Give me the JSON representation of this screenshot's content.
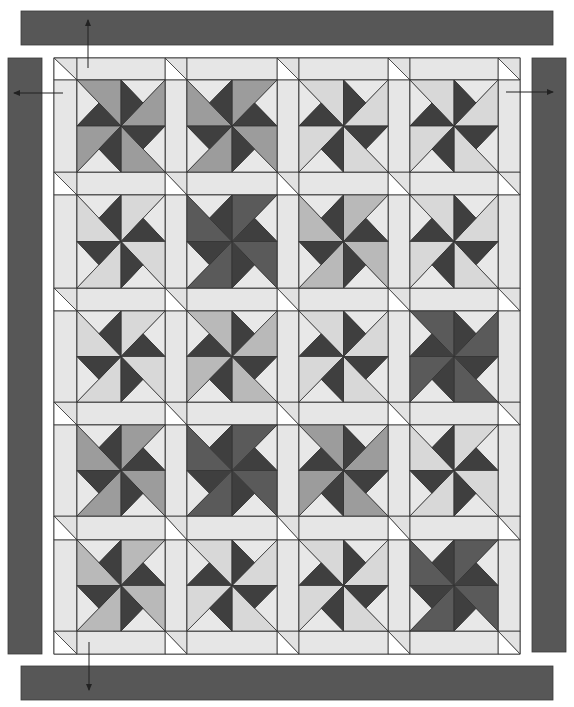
{
  "diagram": {
    "canvas": {
      "width": 574,
      "height": 707
    },
    "colors": {
      "background": "#ffffff",
      "border_bar": "#575757",
      "sashing": "#e6e6e6",
      "cornerstone_light": "#e2e2e2",
      "cornerstone_white": "#ffffff",
      "block_background": "#e8e8e8",
      "small_dark": "#3f3f3f",
      "outline": "#333333",
      "tones": {
        "dark": "#5a5a5a",
        "med": "#9c9c9c",
        "medlight": "#b9b9b9",
        "light": "#d8d8d8"
      }
    },
    "quilt": {
      "x": 54,
      "y": 58,
      "width": 466,
      "height": 596,
      "columns": 4,
      "rows": 5,
      "col_edges": [
        [
          77,
          165
        ],
        [
          187,
          277
        ],
        [
          299,
          388
        ],
        [
          410,
          498
        ]
      ],
      "row_edges": [
        [
          80,
          172
        ],
        [
          195,
          288
        ],
        [
          311,
          402
        ],
        [
          425,
          516
        ],
        [
          540,
          631
        ]
      ]
    },
    "blocks": [
      [
        {
          "type": "A",
          "tone": "med"
        },
        {
          "type": "B",
          "tone": "med"
        },
        {
          "type": "A",
          "tone": "light"
        },
        {
          "type": "A",
          "tone": "light"
        }
      ],
      [
        {
          "type": "B",
          "tone": "light"
        },
        {
          "type": "B",
          "tone": "dark"
        },
        {
          "type": "B",
          "tone": "medlight"
        },
        {
          "type": "A",
          "tone": "light"
        }
      ],
      [
        {
          "type": "B",
          "tone": "light"
        },
        {
          "type": "A",
          "tone": "medlight"
        },
        {
          "type": "A",
          "tone": "light"
        },
        {
          "type": "A",
          "tone": "dark"
        }
      ],
      [
        {
          "type": "B",
          "tone": "med"
        },
        {
          "type": "B",
          "tone": "dark"
        },
        {
          "type": "A",
          "tone": "med"
        },
        {
          "type": "B",
          "tone": "light"
        }
      ],
      [
        {
          "type": "B",
          "tone": "medlight"
        },
        {
          "type": "A",
          "tone": "light"
        },
        {
          "type": "A",
          "tone": "light"
        },
        {
          "type": "B",
          "tone": "dark"
        }
      ]
    ],
    "borders": [
      {
        "name": "top-border",
        "x": 21,
        "y": 11,
        "width": 532,
        "height": 34
      },
      {
        "name": "left-border",
        "x": 8,
        "y": 58,
        "width": 34,
        "height": 596
      },
      {
        "name": "right-border",
        "x": 532,
        "y": 58,
        "width": 34,
        "height": 594
      },
      {
        "name": "bottom-border",
        "x": 21,
        "y": 666,
        "width": 532,
        "height": 34
      }
    ],
    "arrows": [
      {
        "name": "arrow-up",
        "x1": 88,
        "y1": 68,
        "x2": 88,
        "y2": 20
      },
      {
        "name": "arrow-left",
        "x1": 63,
        "y1": 93,
        "x2": 14,
        "y2": 93
      },
      {
        "name": "arrow-right",
        "x1": 506,
        "y1": 92,
        "x2": 553,
        "y2": 92
      },
      {
        "name": "arrow-down",
        "x1": 89,
        "y1": 642,
        "x2": 89,
        "y2": 690
      }
    ]
  }
}
